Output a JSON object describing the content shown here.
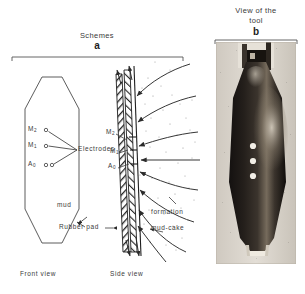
{
  "figure": {
    "panel_a": {
      "title": "Schemes",
      "letter": "a",
      "front_view_caption": "Front view",
      "side_view_caption": "Side view",
      "labels": {
        "electrodes": "Electrodes",
        "mud": "mud",
        "rubber_pad": "Rubber pad",
        "mud_cake": "mud-cake",
        "formation": "formation"
      },
      "electrodes_front": [
        {
          "name": "M2",
          "base": "M",
          "sub": "2",
          "markers": 1
        },
        {
          "name": "M1",
          "base": "M",
          "sub": "1",
          "markers": 1
        },
        {
          "name": "A0",
          "base": "A",
          "sub": "0",
          "markers": 2
        }
      ],
      "electrodes_side": [
        {
          "name": "M2",
          "base": "M",
          "sub": "2"
        },
        {
          "name": "M1",
          "base": "M",
          "sub": "1"
        },
        {
          "name": "A0",
          "base": "A",
          "sub": "0"
        }
      ]
    },
    "panel_b": {
      "title_line1": "View of the",
      "title_line2": "tool",
      "letter": "b",
      "electrode_dots": 3
    }
  },
  "colors": {
    "ink": "#2b2b2b",
    "line": "#3c3c3c",
    "photo_dark": "#1a1613",
    "photo_mid": "#4a423b",
    "photo_light": "#cfc8bd",
    "paper": "#ffffff"
  }
}
